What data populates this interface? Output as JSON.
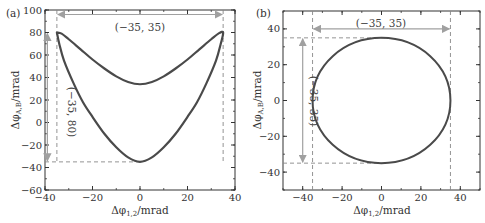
{
  "chart_data": [
    {
      "type": "line",
      "panel_label": "(a)",
      "title": "",
      "xlabel": "Δφ1,2/mrad",
      "ylabel": "Δφ A,B/mrad",
      "xlim": [
        -40,
        40
      ],
      "ylim": [
        -60,
        100
      ],
      "xticks": [
        -40,
        -20,
        0,
        20,
        40
      ],
      "yticks": [
        -60,
        -40,
        -20,
        0,
        20,
        40,
        60,
        80,
        100
      ],
      "xtick_labels": [
        "−40",
        "−20",
        "0",
        "20",
        "40"
      ],
      "ytick_labels": [
        "−60",
        "−40",
        "−20",
        "0",
        "20",
        "40",
        "60",
        "80",
        "100"
      ],
      "grid": false,
      "series": [
        {
          "name": "closed curve (boomerang)",
          "x": [
            -35,
            -33,
            -30,
            -25,
            -20,
            -15,
            -10,
            -5,
            0,
            5,
            10,
            15,
            20,
            25,
            30,
            33,
            35,
            34,
            32,
            28,
            24,
            20,
            15,
            10,
            5,
            0,
            -5,
            -10,
            -15,
            -20,
            -24,
            -28,
            -32,
            -34,
            -35
          ],
          "y": [
            80,
            79,
            74,
            65,
            56,
            48,
            41,
            36,
            34,
            36,
            41,
            48,
            56,
            65,
            74,
            79,
            80,
            70,
            55,
            35,
            18,
            5,
            -10,
            -22,
            -31,
            -35,
            -31,
            -22,
            -10,
            5,
            18,
            35,
            55,
            70,
            80
          ]
        }
      ],
      "annotations": [
        {
          "text": "(−35, 35)",
          "type": "horizontal-arrow",
          "from_x": -35,
          "to_x": 35,
          "at_y": 96
        },
        {
          "text": "(−35, 80)",
          "type": "vertical-arrow",
          "from_y": 80,
          "to_y": -35,
          "at_x": -39
        },
        {
          "type": "dashed-line",
          "orientation": "vertical",
          "x": -35
        },
        {
          "type": "dashed-line",
          "orientation": "vertical",
          "x": 35
        },
        {
          "type": "dashed-line",
          "orientation": "horizontal",
          "y": -35
        }
      ]
    },
    {
      "type": "line",
      "panel_label": "(b)",
      "title": "",
      "xlabel": "Δφ1,2/mrad",
      "ylabel": "Δφ A,B/mrad",
      "xlim": [
        -50,
        50
      ],
      "ylim": [
        -50,
        50
      ],
      "xticks": [
        -40,
        -20,
        0,
        20,
        40
      ],
      "yticks": [
        -40,
        -20,
        0,
        20,
        40
      ],
      "xtick_labels": [
        "−40",
        "−20",
        "0",
        "20",
        "40"
      ],
      "ytick_labels": [
        "−40",
        "−20",
        "0",
        "20",
        "40"
      ],
      "grid": false,
      "series": [
        {
          "name": "circle",
          "center": [
            0,
            0
          ],
          "radius": 35,
          "x": [
            35,
            30.3,
            17.5,
            0,
            -17.5,
            -30.3,
            -35,
            -30.3,
            -17.5,
            0,
            17.5,
            30.3,
            35
          ],
          "y": [
            0,
            17.5,
            30.3,
            35,
            30.3,
            17.5,
            0,
            -17.5,
            -30.3,
            -35,
            -30.3,
            -17.5,
            0
          ]
        }
      ],
      "annotations": [
        {
          "text": "(−35, 35)",
          "type": "horizontal-arrow",
          "from_x": -35,
          "to_x": 35,
          "at_y": 40
        },
        {
          "text": "(−35, 35)",
          "type": "vertical-arrow",
          "from_y": 35,
          "to_y": -35,
          "at_x": -40
        },
        {
          "type": "dashed-line",
          "orientation": "vertical",
          "x": -35
        },
        {
          "type": "dashed-line",
          "orientation": "vertical",
          "x": 35
        },
        {
          "type": "dashed-line",
          "orientation": "horizontal",
          "y": 35
        },
        {
          "type": "dashed-line",
          "orientation": "horizontal",
          "y": -35
        }
      ]
    }
  ],
  "labels": {
    "a": {
      "panel": "(a)",
      "xlabel_main": "Δφ",
      "xlabel_sub": "1,2",
      "xlabel_unit": "/mrad",
      "ylabel_main": "Δφ",
      "ylabel_sub": "A,B",
      "ylabel_unit": "/mrad",
      "anno_h": "(−35, 35)",
      "anno_v": "(−35, 80)"
    },
    "b": {
      "panel": "(b)",
      "xlabel_main": "Δφ",
      "xlabel_sub": "1,2",
      "xlabel_unit": "/mrad",
      "ylabel_main": "Δφ",
      "ylabel_sub": "A,B",
      "ylabel_unit": "/mrad",
      "anno_h": "(−35, 35)",
      "anno_v": "(−35, 35)"
    }
  },
  "colors": {
    "curve": "#4a4a4a",
    "axis": "#333333",
    "annotation": "#a0a0a0",
    "dashed": "#888888"
  }
}
